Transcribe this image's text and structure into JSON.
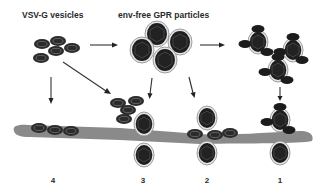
{
  "labels": {
    "vsvg": "VSV-G  vesicles",
    "gpr": "env-free  GPR  particles"
  },
  "pathways": [
    {
      "id": "4",
      "label": "4"
    },
    {
      "id": "3",
      "label": "3"
    },
    {
      "id": "2",
      "label": "2"
    },
    {
      "id": "1",
      "label": "1"
    }
  ],
  "colors": {
    "membrane": "#8a8a8a",
    "particle": "#1e1e1e",
    "vesicle": "#2b2b2b",
    "arrow": "#333333"
  }
}
